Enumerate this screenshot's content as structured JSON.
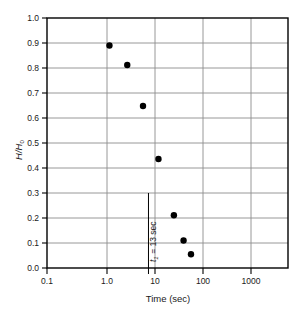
{
  "chart_data": {
    "type": "scatter",
    "title": "",
    "xlabel": "Time (sec)",
    "ylabel": "H/H0",
    "ylabel_parts": {
      "numerator": "H",
      "slash": "/",
      "denominator": "H",
      "denominator_sub": "0"
    },
    "xscale": "log",
    "yscale": "linear",
    "xlim": [
      0.1,
      5000
    ],
    "ylim": [
      0.0,
      1.0
    ],
    "grid": true,
    "legend": null,
    "xticks": [
      0.1,
      1.0,
      10,
      100,
      1000
    ],
    "xtick_labels": [
      "0.1",
      "1.0",
      "10",
      "100",
      "1000"
    ],
    "yticks": [
      0.0,
      0.1,
      0.2,
      0.3,
      0.4,
      0.5,
      0.6,
      0.7,
      0.8,
      0.9,
      1.0
    ],
    "ytick_labels": [
      "0.0",
      "0.1",
      "0.2",
      "0.3",
      "0.4",
      "0.5",
      "0.6",
      "0.7",
      "0.8",
      "0.9",
      "1.0"
    ],
    "points": [
      {
        "x": 2.0,
        "y": 0.89
      },
      {
        "x": 4.7,
        "y": 0.812
      },
      {
        "x": 10.0,
        "y": 0.648
      },
      {
        "x": 21.0,
        "y": 0.436
      },
      {
        "x": 44.0,
        "y": 0.211
      },
      {
        "x": 70.0,
        "y": 0.11
      },
      {
        "x": 100.0,
        "y": 0.055
      }
    ],
    "annotations": [
      {
        "name": "t1-vertical-line",
        "x": 13,
        "y_from": 0.0,
        "y_to": 0.3,
        "label": "t1 = 13 sec",
        "label_symbol": "t",
        "label_subscript": "1",
        "label_rest": " = 13 sec",
        "orientation": "vertical"
      }
    ],
    "colors": {
      "marker": "#000000",
      "grid": "#8c8c8c",
      "axis": "#000000",
      "text": "#1a1a1a",
      "background": "#ffffff"
    }
  }
}
